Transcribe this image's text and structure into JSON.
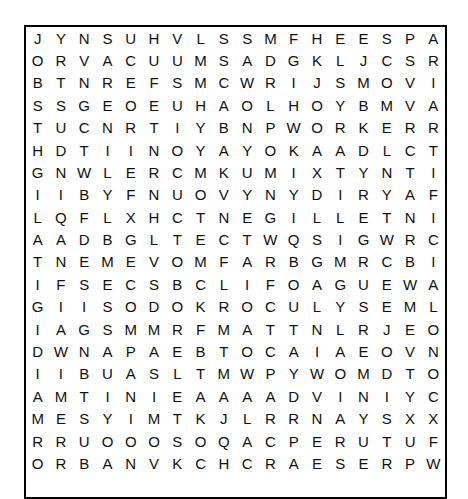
{
  "puzzle": {
    "type": "word-search",
    "columns": 18,
    "rows_count": 21,
    "rows": [
      "JYNSUHVLSSMFHEESPACE",
      "ORVACUUMSADGKLJCSRCG",
      "BTNREFSMCWRIJSMOVING",
      "SSGEOEUHAOLHOYBMVAEX",
      "TUCNRTIYBNPWORKERRQE",
      "HDTIINOYAYOKAADLCTFV",
      "GNWLERCMKUMIXTYNTIGH",
      "IIBYFNUOVYNYDIRYAFWN",
      "LQFLXHCTNEGILLETNIWZ",
      "AADBGLTECTWQSIGWRCNJ",
      "TNEMEVOMFARBGMRCBIBP",
      "IFSECSBCLIFOAGUEWAJD",
      "GIISODOKROCULYSEMLZA",
      "IAGSMMRFMATTNLRJEOJN",
      "DWNAPAEBTOCAIAEOVNTC",
      "IIBUASLTMWPYWOMDTOSE",
      "AMTINIEAAAADVINIYCMW",
      "MESYIMTKJLRRNAYSXXAY",
      "RRUOOOSOQACPERUTUFRF",
      "ORBANVKCHCRAESERPWTQ"
    ],
    "found_words": [
      "SPACE",
      "VACUUM",
      "MOVING",
      "WORKER",
      "INTELLIGENT",
      "MOVEMENT",
      "FUTURE",
      "RESEARCH"
    ]
  }
}
